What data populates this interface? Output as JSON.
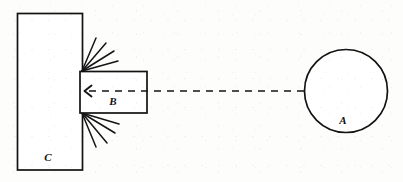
{
  "figure": {
    "kind": "mechanical-impact-diagram",
    "background_color": "#fdfdfc",
    "ink_color": "#121212",
    "labels": {
      "circle_a": "A",
      "bar_b": "B",
      "block_c": "C"
    },
    "shapes": {
      "block_c": {
        "name": "block-c",
        "type": "rectangle",
        "x": 17,
        "y": 13,
        "width": 65,
        "height": 157
      },
      "bar_b": {
        "name": "bar-b",
        "type": "rectangle",
        "x": 80,
        "y": 71,
        "width": 67,
        "height": 42
      },
      "circle_a": {
        "name": "circle-a",
        "type": "circle",
        "cx": 346,
        "cy": 91,
        "r": 42
      }
    },
    "motion_arrow": {
      "name": "motion-arrow",
      "style": "dashed",
      "direction": "leftward",
      "from_x": 304,
      "to_x": 88,
      "y": 91,
      "arrowhead_x": 85,
      "dash_pattern": "7 6"
    },
    "impact_sparks": {
      "name": "impact-sparks",
      "upper_origin": {
        "x": 82,
        "y": 71
      },
      "lower_origin": {
        "x": 82,
        "y": 113
      },
      "upper_rays": [
        {
          "x2": 96,
          "y2": 38
        },
        {
          "x2": 106,
          "y2": 43
        },
        {
          "x2": 114,
          "y2": 51
        },
        {
          "x2": 118,
          "y2": 60
        }
      ],
      "lower_rays": [
        {
          "x2": 96,
          "y2": 147
        },
        {
          "x2": 107,
          "y2": 143
        },
        {
          "x2": 115,
          "y2": 133
        },
        {
          "x2": 119,
          "y2": 123
        }
      ]
    },
    "label_positions": {
      "circle_a": {
        "x": 343,
        "y": 124
      },
      "bar_b": {
        "x": 113,
        "y": 105
      },
      "block_c": {
        "x": 48,
        "y": 161
      }
    }
  }
}
